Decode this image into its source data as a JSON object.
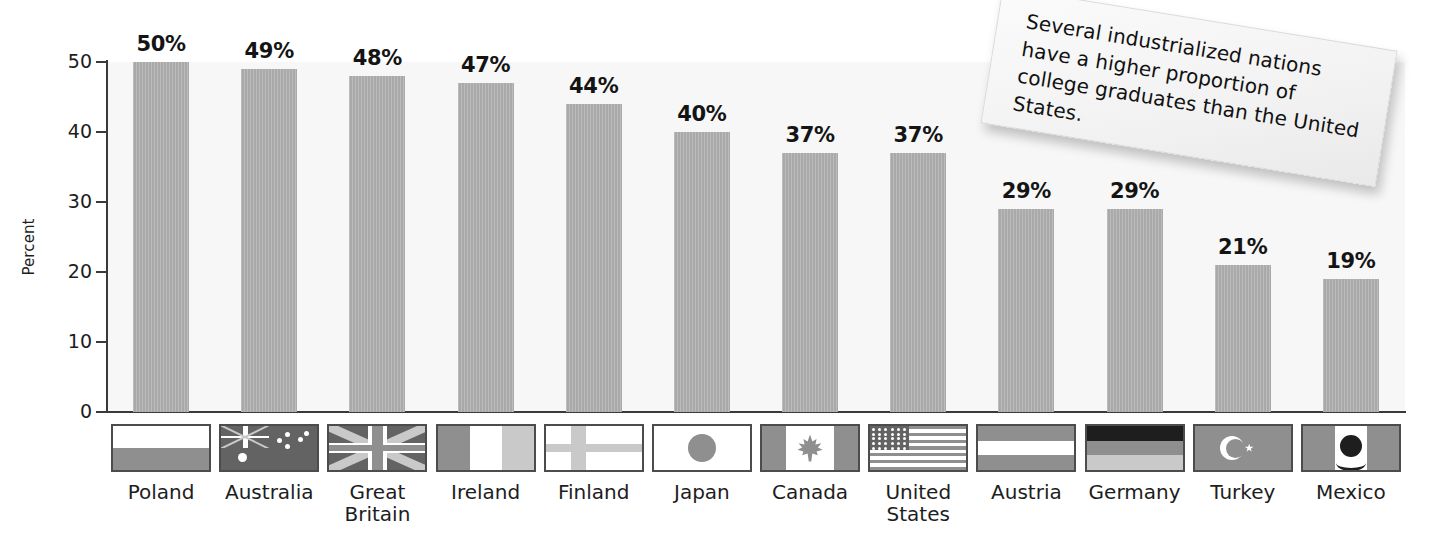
{
  "chart_data": {
    "type": "bar",
    "title": "",
    "xlabel": "",
    "ylabel": "Percent",
    "ylim": [
      0,
      50
    ],
    "yticks": [
      0,
      10,
      20,
      30,
      40,
      50
    ],
    "ytick_labels": [
      "0",
      "10",
      "20",
      "30",
      "40",
      "50"
    ],
    "grid": false,
    "legend": null,
    "categories": [
      "Poland",
      "Australia",
      "Great Britain",
      "Ireland",
      "Finland",
      "Japan",
      "Canada",
      "United States",
      "Austria",
      "Germany",
      "Turkey",
      "Mexico"
    ],
    "values": [
      50,
      49,
      48,
      47,
      44,
      40,
      37,
      37,
      29,
      29,
      21,
      19
    ],
    "value_labels": [
      "50%",
      "49%",
      "48%",
      "47%",
      "44%",
      "40%",
      "37%",
      "37%",
      "29%",
      "29%",
      "21%",
      "19%"
    ],
    "bar_color": "#a9a9a9",
    "plot_background": "#f7f7f7",
    "axis_color": "#3a3a3a",
    "annotations": [
      "Several industrialized nations have a higher proportion of college graduates than the United States."
    ]
  },
  "axis": {
    "y_title": "Percent"
  },
  "categories": [
    {
      "label_line1": "Poland",
      "label_line2": "",
      "value_label": "50%",
      "value": 50,
      "flag": "poland-flag"
    },
    {
      "label_line1": "Australia",
      "label_line2": "",
      "value_label": "49%",
      "value": 49,
      "flag": "australia-flag"
    },
    {
      "label_line1": "Great",
      "label_line2": "Britain",
      "value_label": "48%",
      "value": 48,
      "flag": "great-britain-flag"
    },
    {
      "label_line1": "Ireland",
      "label_line2": "",
      "value_label": "47%",
      "value": 47,
      "flag": "ireland-flag"
    },
    {
      "label_line1": "Finland",
      "label_line2": "",
      "value_label": "44%",
      "value": 44,
      "flag": "finland-flag"
    },
    {
      "label_line1": "Japan",
      "label_line2": "",
      "value_label": "40%",
      "value": 40,
      "flag": "japan-flag"
    },
    {
      "label_line1": "Canada",
      "label_line2": "",
      "value_label": "37%",
      "value": 37,
      "flag": "canada-flag"
    },
    {
      "label_line1": "United",
      "label_line2": "States",
      "value_label": "37%",
      "value": 37,
      "flag": "united-states-flag"
    },
    {
      "label_line1": "Austria",
      "label_line2": "",
      "value_label": "29%",
      "value": 29,
      "flag": "austria-flag"
    },
    {
      "label_line1": "Germany",
      "label_line2": "",
      "value_label": "29%",
      "value": 29,
      "flag": "germany-flag"
    },
    {
      "label_line1": "Turkey",
      "label_line2": "",
      "value_label": "21%",
      "value": 21,
      "flag": "turkey-flag"
    },
    {
      "label_line1": "Mexico",
      "label_line2": "",
      "value_label": "19%",
      "value": 19,
      "flag": "mexico-flag"
    }
  ],
  "yticks": [
    {
      "label": "50"
    },
    {
      "label": "40"
    },
    {
      "label": "30"
    },
    {
      "label": "20"
    },
    {
      "label": "10"
    },
    {
      "label": "0"
    }
  ],
  "callout": {
    "text": "Several industrialized nations have a higher proportion of college graduates than the United States."
  }
}
